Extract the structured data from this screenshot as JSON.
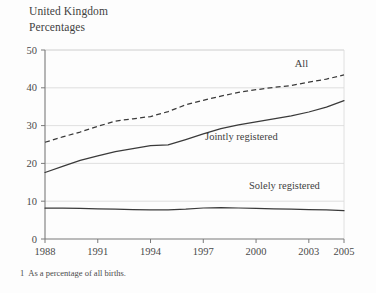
{
  "header": {
    "region": "United Kingdom",
    "units": "Percentages"
  },
  "footnote": {
    "marker": "1",
    "text": "As a percentage of all births."
  },
  "colors": {
    "background": "#fdfdfd",
    "line": "#3a3a3a",
    "gridline": "#d8d8d8",
    "axis": "#7a7a7a",
    "text": "#4a4a4a"
  },
  "chart_data": {
    "type": "line",
    "title": "United Kingdom",
    "subtitle": "Percentages",
    "xlabel": "",
    "ylabel": "",
    "xlim": [
      1988,
      2005
    ],
    "ylim": [
      0,
      50
    ],
    "yticks": [
      0,
      10,
      20,
      30,
      40,
      50
    ],
    "ytick_labels": [
      "0",
      "10",
      "20",
      "30",
      "40",
      "50"
    ],
    "xticks": [
      1988,
      1991,
      1994,
      1997,
      2000,
      2003,
      2005
    ],
    "xtick_labels": [
      "1988",
      "1991",
      "1994",
      "1997",
      "2000",
      "2003",
      "2005"
    ],
    "grid": true,
    "grid_axis": "y",
    "legend": "inline-annotations",
    "x": [
      1988,
      1989,
      1990,
      1991,
      1992,
      1993,
      1994,
      1995,
      1996,
      1997,
      1998,
      1999,
      2000,
      2001,
      2002,
      2003,
      2004,
      2005
    ],
    "series": [
      {
        "name": "All",
        "style": "dashed",
        "label": "All",
        "label_x": 2002.2,
        "label_y": 45.6,
        "values": [
          25.6,
          27.0,
          28.3,
          29.8,
          31.2,
          31.8,
          32.4,
          33.7,
          35.5,
          36.7,
          37.8,
          38.8,
          39.5,
          40.1,
          40.6,
          41.5,
          42.3,
          43.4
        ]
      },
      {
        "name": "Jointly registered",
        "style": "solid",
        "label": "Jointly registered",
        "label_x": 1997.1,
        "label_y": 26.3,
        "values": [
          17.6,
          19.2,
          20.8,
          22.0,
          23.1,
          23.9,
          24.7,
          24.9,
          26.3,
          27.8,
          29.2,
          30.2,
          31.0,
          31.8,
          32.6,
          33.6,
          34.9,
          36.6
        ]
      },
      {
        "name": "Solely registered",
        "style": "solid",
        "label": "Solely registered",
        "label_x": 1999.6,
        "label_y": 13.2,
        "values": [
          8.2,
          8.2,
          8.1,
          8.0,
          7.9,
          7.8,
          7.7,
          7.7,
          7.9,
          8.2,
          8.3,
          8.2,
          8.1,
          8.0,
          7.9,
          7.8,
          7.7,
          7.5
        ]
      }
    ]
  }
}
